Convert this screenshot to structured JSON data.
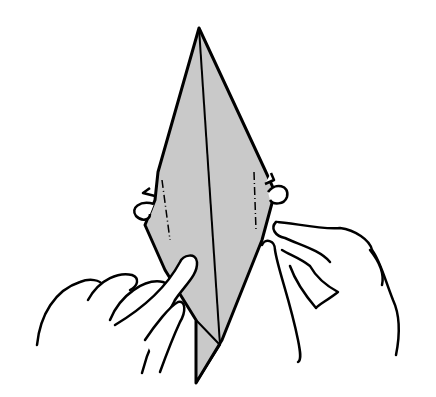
{
  "figure": {
    "type": "origami-instruction-step",
    "colors": {
      "paper_fill": "#c9c9c9",
      "outline": "#000000",
      "background": "#ffffff"
    },
    "elements": [
      {
        "name": "folded-paper",
        "shape": "elongated-diamond"
      },
      {
        "name": "center-crease",
        "style": "solid"
      },
      {
        "name": "left-valley-fold-line",
        "style": "dash-dot"
      },
      {
        "name": "right-valley-fold-line",
        "style": "dash-dot"
      },
      {
        "name": "left-flap",
        "style": "outline"
      },
      {
        "name": "right-flap",
        "style": "outline"
      },
      {
        "name": "left-hand",
        "action": "holding lower-left edge"
      },
      {
        "name": "right-hand",
        "action": "pinching right edge"
      }
    ]
  },
  "labels": {
    "alt": "Origami folding step illustration with two hands holding a grey diamond-shaped model"
  }
}
